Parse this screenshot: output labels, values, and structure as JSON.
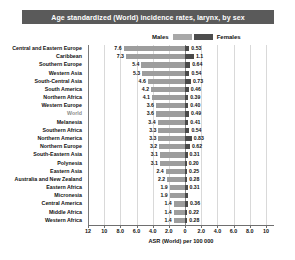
{
  "header": {
    "title": "Age standardized (World) incidence rates, larynx, by sex"
  },
  "legend": {
    "male_label": "Males",
    "female_label": "Females",
    "male_color": "#9d9d9d",
    "female_color": "#4a4a4a",
    "position": "top-center"
  },
  "axis": {
    "xlabel": "ASR (World) per 100 000",
    "ticks": [
      "12",
      "10",
      "8.0",
      "6.0",
      "4.0",
      "2.0",
      "0",
      "2.0",
      "4.0",
      "6.0",
      "8.0",
      "10"
    ],
    "tick_values": [
      -12,
      -10,
      -8,
      -6,
      -4,
      -2,
      0,
      2,
      4,
      6,
      8,
      10
    ],
    "left_max": 12,
    "right_max": 11
  },
  "chart_data": {
    "type": "bar",
    "orientation": "horizontal-diverging",
    "title": "Age standardized (World) incidence rates, larynx, by sex",
    "xlabel": "ASR (World) per 100 000",
    "ylabel": "",
    "xlim": [
      -12,
      11
    ],
    "grid": true,
    "legend_position": "top-center",
    "categories": [
      "Central and Eastern Europe",
      "Caribbean",
      "Southern Europe",
      "Western Asia",
      "South-Central Asia",
      "South America",
      "Northern Africa",
      "Western Europe",
      "World",
      "Melanesia",
      "Southern Africa",
      "Northern America",
      "Northern Europe",
      "South-Eastern Asia",
      "Polynesia",
      "Eastern Asia",
      "Australia and New Zealand",
      "Eastern Africa",
      "Micronesia",
      "Central America",
      "Middle Africa",
      "Western Africa"
    ],
    "series": [
      {
        "name": "Males",
        "color": "#9d9d9d",
        "values": [
          7.6,
          7.3,
          5.4,
          5.3,
          4.6,
          4.2,
          4.1,
          3.6,
          3.6,
          3.4,
          3.3,
          3.3,
          3.2,
          3.1,
          3.1,
          2.4,
          2.2,
          1.9,
          1.9,
          1.4,
          1.4,
          1.4
        ],
        "labels": [
          "7.6",
          "7.3",
          "5.4",
          "5.3",
          "4.6",
          "4.2",
          "4.1",
          "3.6",
          "3.6",
          "3.4",
          "3.3",
          "3.3",
          "3.2",
          "3.1",
          "3.1",
          "2.4",
          "2.2",
          "1.9",
          "1.9",
          "1.4",
          "1.4",
          "1.4"
        ]
      },
      {
        "name": "Females",
        "color": "#4a4a4a",
        "values": [
          0.53,
          1.1,
          0.64,
          0.54,
          0.73,
          0.46,
          0.39,
          0.4,
          0.49,
          0.41,
          0.54,
          0.83,
          0.62,
          0.31,
          0.2,
          0.25,
          0.28,
          0.31,
          0.4,
          0.36,
          0.22,
          0.28
        ],
        "labels": [
          "0.53",
          "1.1",
          "0.64",
          "0.54",
          "0.73",
          "0.46",
          "0.39",
          "0.40",
          "0.49",
          "0.41",
          "0.54",
          "0.83",
          "0.62",
          "0.31",
          "0.20",
          "0.25",
          "0.28",
          "0.31",
          "",
          "0.36",
          "0.22",
          "0.28"
        ]
      }
    ],
    "highlight_category": "World"
  }
}
